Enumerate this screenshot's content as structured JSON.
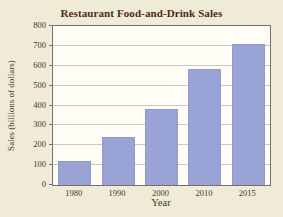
{
  "chart_data": {
    "type": "bar",
    "title": "Restaurant Food-and-Drink Sales",
    "categories": [
      "1980",
      "1990",
      "2000",
      "2010",
      "2015"
    ],
    "values": [
      120,
      240,
      380,
      585,
      710
    ],
    "xlabel": "Year",
    "ylabel": "Sales (billions of dollars)",
    "ylim": [
      0,
      800
    ],
    "yticks": [
      0,
      100,
      200,
      300,
      400,
      500,
      600,
      700,
      800
    ],
    "grid": true,
    "legend": "none",
    "colors": {
      "bar": "#9aa3d6",
      "page_background": "#f0ebd6",
      "plot_background": "#fffdf6",
      "gridline": "#cac9c1",
      "axis_border": "#73726a",
      "title_text": "#4e2a16",
      "label_text": "#403a2b"
    }
  }
}
